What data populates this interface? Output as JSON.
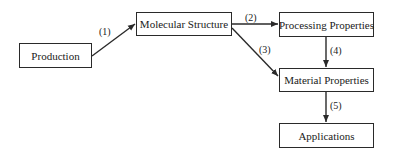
{
  "nodes": [
    {
      "id": "production",
      "label": "Production"
    },
    {
      "id": "molecular",
      "label": "Molecular Structure"
    },
    {
      "id": "processing",
      "label": "Processing Properties"
    },
    {
      "id": "material",
      "label": "Material Properties"
    },
    {
      "id": "applications",
      "label": "Applications"
    }
  ],
  "edges": [
    {
      "from": "production",
      "to": "molecular",
      "label": "(1)"
    },
    {
      "from": "molecular",
      "to": "processing",
      "label": "(2)"
    },
    {
      "from": "molecular",
      "to": "material",
      "label": "(3)"
    },
    {
      "from": "processing",
      "to": "material",
      "label": "(4)"
    },
    {
      "from": "material",
      "to": "applications",
      "label": "(5)"
    }
  ]
}
